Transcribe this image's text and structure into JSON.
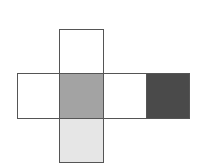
{
  "diagram": {
    "type": "cube-net",
    "faces": [
      {
        "id": "top",
        "x": 59,
        "y": 29,
        "w": 45,
        "h": 45,
        "fill": "#ffffff"
      },
      {
        "id": "left",
        "x": 17,
        "y": 73,
        "w": 43,
        "h": 46,
        "fill": "#ffffff"
      },
      {
        "id": "center",
        "x": 59,
        "y": 73,
        "w": 45,
        "h": 46,
        "fill": "#a3a3a3"
      },
      {
        "id": "right",
        "x": 103,
        "y": 73,
        "w": 44,
        "h": 46,
        "fill": "#ffffff"
      },
      {
        "id": "far-right",
        "x": 146,
        "y": 73,
        "w": 44,
        "h": 46,
        "fill": "#4a4a4a"
      },
      {
        "id": "bottom",
        "x": 59,
        "y": 118,
        "w": 45,
        "h": 45,
        "fill": "#e6e6e6"
      }
    ],
    "border_color": "#555555"
  }
}
